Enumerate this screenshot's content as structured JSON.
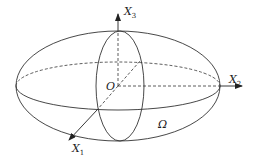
{
  "diagram": {
    "labels": {
      "x1": "X",
      "x1_sub": "1",
      "x2": "X",
      "x2_sub": "2",
      "x3": "X",
      "x3_sub": "3",
      "origin": "O",
      "domain": "Ω"
    },
    "colors": {
      "stroke": "#333333",
      "background": "#ffffff"
    }
  }
}
